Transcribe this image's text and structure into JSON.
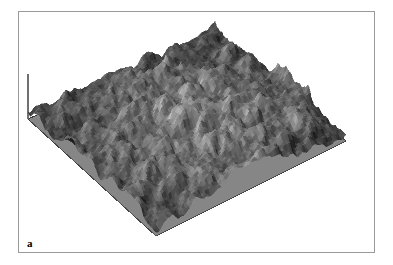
{
  "figure": {
    "panel_label": "a",
    "type": "3d-surface-topography",
    "background_color": "#ffffff",
    "frame_color": "#9a9a9a"
  },
  "chart_data": {
    "type": "heatmap",
    "render": "3d-surface-isometric",
    "title": "",
    "subtitle": "",
    "xlabel": "",
    "ylabel": "",
    "zlabel": "",
    "tick_labels": [],
    "legend": [],
    "grid": false,
    "annotations": [
      "a"
    ],
    "colormap": "grayscale",
    "color_low": "#141414",
    "color_high": "#f0f0f0",
    "base_plane_color": "#8a8a8a",
    "base_plane_edge_color": "#3a3a3a",
    "axis_line_color": "#707070",
    "projection": {
      "left_vertex": [
        9,
        107
      ],
      "bottom_vertex": [
        137,
        224
      ],
      "right_vertex": [
        327,
        129
      ],
      "top_vertex": [
        196,
        25
      ]
    },
    "z_axis_line": {
      "x": 9,
      "y_top": 62,
      "y_bottom": 107
    },
    "grid_nx": 96,
    "grid_ny": 96,
    "height_stats": {
      "min": 0,
      "max": 1,
      "mean": 0.34,
      "roughness_rms": 0.19
    },
    "peak_count_estimate": 150,
    "surface_values_note": "Pseudo-random multi-octave granular height field; values normalized 0-1."
  }
}
